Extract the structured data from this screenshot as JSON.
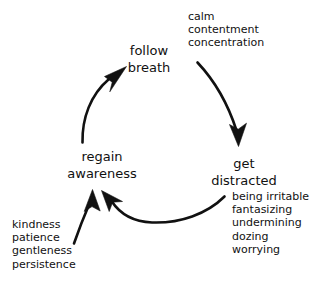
{
  "diagram": {
    "type": "cycle-diagram",
    "background_color": "#ffffff",
    "stroke_color": "#111111",
    "text_color": "#111111",
    "nodes": [
      {
        "id": "follow-breath",
        "lines": [
          "follow",
          "breath"
        ]
      },
      {
        "id": "get-distracted",
        "lines": [
          "get",
          "distracted"
        ]
      },
      {
        "id": "regain-awareness",
        "lines": [
          "regain",
          "awareness"
        ]
      }
    ],
    "annotations": [
      {
        "id": "positive",
        "attached_to": "follow-breath",
        "lines": [
          "calm",
          "contentment",
          "concentration"
        ]
      },
      {
        "id": "distractions",
        "attached_to": "get-distracted",
        "lines": [
          "being irritable",
          "fantasizing",
          "undermining",
          "dozing",
          "worrying"
        ]
      },
      {
        "id": "qualities",
        "attached_to": "regain-awareness",
        "lines": [
          "kindness",
          "patience",
          "gentleness",
          "persistence"
        ]
      }
    ],
    "arrows": [
      {
        "id": "breath-to-distracted",
        "from": "follow-breath",
        "to": "get-distracted"
      },
      {
        "id": "distracted-to-regain",
        "from": "get-distracted",
        "to": "regain-awareness"
      },
      {
        "id": "regain-to-breath",
        "from": "regain-awareness",
        "to": "follow-breath"
      },
      {
        "id": "qualities-to-regain",
        "from": "qualities",
        "to": "regain-awareness"
      }
    ]
  }
}
